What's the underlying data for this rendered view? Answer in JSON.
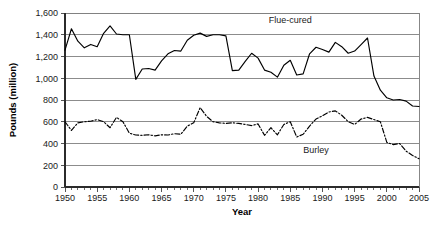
{
  "chart_data": {
    "type": "line",
    "title": "",
    "xlabel": "Year",
    "ylabel": "Pounds (million)",
    "xlim": [
      1950,
      2005
    ],
    "ylim": [
      0,
      1600
    ],
    "grid": true,
    "legend": "inline-annotations",
    "y_ticks": [
      0,
      200,
      400,
      600,
      800,
      1000,
      1200,
      1400,
      1600
    ],
    "y_tick_labels": [
      "0",
      "200",
      "400",
      "600",
      "800",
      "1,000",
      "1,200",
      "1,400",
      "1,600"
    ],
    "x_ticks": [
      1950,
      1955,
      1960,
      1965,
      1970,
      1975,
      1980,
      1985,
      1990,
      1995,
      2000,
      2005
    ],
    "x_tick_labels": [
      "1950",
      "1955",
      "1960",
      "1965",
      "1970",
      "1975",
      "1980",
      "1985",
      "1990",
      "1995",
      "2000",
      "2005"
    ],
    "x_minor_tick_step": 1,
    "x": [
      1950,
      1951,
      1952,
      1953,
      1954,
      1955,
      1956,
      1957,
      1958,
      1959,
      1960,
      1961,
      1962,
      1963,
      1964,
      1965,
      1966,
      1967,
      1968,
      1969,
      1970,
      1971,
      1972,
      1973,
      1974,
      1975,
      1976,
      1977,
      1978,
      1979,
      1980,
      1981,
      1982,
      1983,
      1984,
      1985,
      1986,
      1987,
      1988,
      1989,
      1990,
      1991,
      1992,
      1993,
      1994,
      1995,
      1996,
      1997,
      1998,
      1999,
      2000,
      2001,
      2002,
      2003,
      2004,
      2005
    ],
    "series": [
      {
        "name": "Flue-cured",
        "style": "solid",
        "color": "#000000",
        "label_x": 1985,
        "label_y": 1510,
        "values": [
          1258,
          1455,
          1341,
          1280,
          1311,
          1290,
          1413,
          1482,
          1407,
          1400,
          1400,
          990,
          1085,
          1090,
          1075,
          1160,
          1225,
          1255,
          1250,
          1350,
          1395,
          1415,
          1385,
          1400,
          1400,
          1390,
          1070,
          1075,
          1155,
          1230,
          1185,
          1075,
          1055,
          1010,
          1120,
          1165,
          1030,
          1040,
          1225,
          1285,
          1265,
          1240,
          1330,
          1290,
          1230,
          1250,
          1310,
          1370,
          1020,
          890,
          820,
          800,
          805,
          790,
          745,
          740
        ],
        "values_detail_note": "solid black line, top series"
      },
      {
        "name": "Burley",
        "style": "dash-dot",
        "color": "#000000",
        "label_x": 1989,
        "label_y": 310,
        "values": [
          600,
          520,
          590,
          600,
          605,
          620,
          600,
          545,
          640,
          600,
          495,
          478,
          475,
          480,
          470,
          480,
          478,
          490,
          485,
          560,
          590,
          730,
          650,
          600,
          590,
          585,
          590,
          585,
          575,
          565,
          580,
          475,
          545,
          480,
          575,
          600,
          460,
          485,
          560,
          625,
          655,
          690,
          700,
          660,
          600,
          575,
          625,
          640,
          620,
          600,
          410,
          390,
          400,
          330,
          290,
          260
        ],
        "values_detail_note": "dash-dot black line, bottom series"
      }
    ]
  },
  "layout": {
    "plot_left": 65,
    "plot_right": 419,
    "plot_top": 13,
    "plot_bottom": 187
  }
}
